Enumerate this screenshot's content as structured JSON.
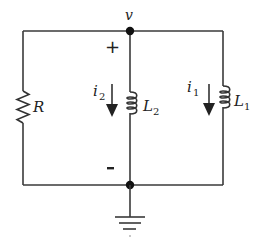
{
  "diagram": {
    "type": "circuit",
    "colors": {
      "wire": "#3a3a3a",
      "text": "#222222",
      "background": "#ffffff"
    },
    "node": {
      "label": "v"
    },
    "polarity": {
      "plus": "+",
      "minus": "-"
    },
    "components": [
      {
        "id": "R",
        "kind": "resistor",
        "label": "R"
      },
      {
        "id": "L2",
        "kind": "inductor",
        "label": "L",
        "subscript": "2"
      },
      {
        "id": "L1",
        "kind": "inductor",
        "label": "L",
        "subscript": "1"
      }
    ],
    "currents": [
      {
        "id": "i2",
        "label": "i",
        "subscript": "2",
        "direction": "down",
        "branch": "L2"
      },
      {
        "id": "i1",
        "label": "i",
        "subscript": "1",
        "direction": "down",
        "branch": "L1"
      }
    ],
    "ground": {
      "label": "ground"
    }
  }
}
